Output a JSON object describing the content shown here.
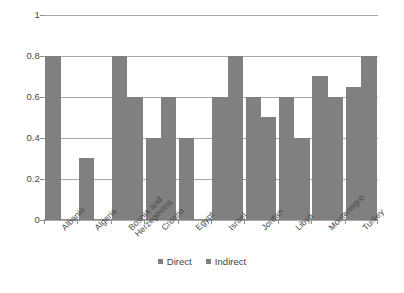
{
  "chart_data": {
    "type": "bar",
    "title": "",
    "xlabel": "",
    "ylabel": "",
    "ylim": [
      0,
      1
    ],
    "yticks": [
      "0",
      "0.2",
      "0.4",
      "0.6",
      "0.8",
      "1"
    ],
    "grid": true,
    "legend_position": "bottom",
    "categories": [
      "Albania",
      "Algeria",
      "Bosnia and Herzegovina",
      "Croatia",
      "Egypt",
      "Israel",
      "Jordan",
      "Libya",
      "Montenegro",
      "Turkey"
    ],
    "series": [
      {
        "name": "Direct",
        "color": "#808080",
        "values": [
          0.8,
          0.3,
          0.8,
          0.4,
          0.4,
          0.6,
          0.6,
          0.6,
          0.7,
          0.65
        ]
      },
      {
        "name": "Indirect",
        "color": "#808080",
        "values": [
          null,
          null,
          0.6,
          0.6,
          null,
          0.8,
          0.5,
          0.4,
          0.6,
          0.8
        ]
      }
    ]
  },
  "legend": {
    "items": [
      {
        "label": "Direct"
      },
      {
        "label": "Indirect"
      }
    ]
  },
  "xlabels": [
    {
      "line1": "Albania",
      "line2": ""
    },
    {
      "line1": "Algeria",
      "line2": ""
    },
    {
      "line1": "Bosnia and",
      "line2": "Herzegovina"
    },
    {
      "line1": "Croatia",
      "line2": ""
    },
    {
      "line1": "Egypt",
      "line2": ""
    },
    {
      "line1": "Israel",
      "line2": ""
    },
    {
      "line1": "Jordan",
      "line2": ""
    },
    {
      "line1": "Libya",
      "line2": ""
    },
    {
      "line1": "Montenegro",
      "line2": ""
    },
    {
      "line1": "Turkey",
      "line2": ""
    }
  ]
}
